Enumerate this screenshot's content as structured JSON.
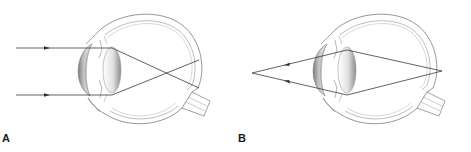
{
  "panels": [
    {
      "label": "A",
      "description": "Parallel light rays entering the eye, refracted by the cornea and lens, crossing and reaching the retina"
    },
    {
      "label": "B",
      "description": "Light rays from a near point source diverging into the eye and converging at a point on the retina"
    }
  ],
  "colors": {
    "outline": "#8a8a8a",
    "ray": "#3a3a3a",
    "label": "#1a1a1a",
    "lens_light": "#f4f4f4",
    "lens_dark": "#9a9a9a"
  }
}
